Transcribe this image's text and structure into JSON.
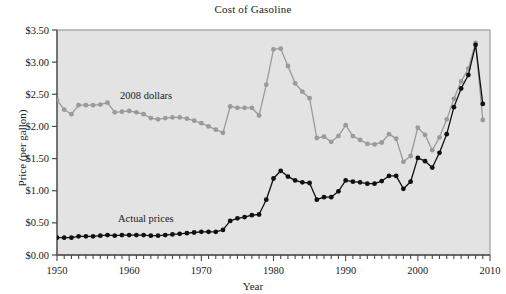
{
  "chart_data": {
    "type": "line",
    "title": "Cost of Gasoline",
    "xlabel": "Year",
    "ylabel": "Price (per gallon)",
    "xlim": [
      1950,
      2010
    ],
    "ylim": [
      0.0,
      3.5
    ],
    "grid": false,
    "legend_position": "inline-annotation",
    "x_tick_labels": [
      "1950",
      "1960",
      "1970",
      "1980",
      "1990",
      "2000",
      "2010"
    ],
    "x_tick_values": [
      1950,
      1960,
      1970,
      1980,
      1990,
      2000,
      2010
    ],
    "x_minor_tick_step": 1,
    "y_tick_labels": [
      "$0.00",
      "$0.50",
      "$1.00",
      "$1.50",
      "$2.00",
      "$2.50",
      "$3.00",
      "$3.50"
    ],
    "y_tick_values": [
      0.0,
      0.5,
      1.0,
      1.5,
      2.0,
      2.5,
      3.0,
      3.5
    ],
    "plot_background": "#e3e3e3",
    "x": [
      1950,
      1951,
      1952,
      1953,
      1954,
      1955,
      1956,
      1957,
      1958,
      1959,
      1960,
      1961,
      1962,
      1963,
      1964,
      1965,
      1966,
      1967,
      1968,
      1969,
      1970,
      1971,
      1972,
      1973,
      1974,
      1975,
      1976,
      1977,
      1978,
      1979,
      1980,
      1981,
      1982,
      1983,
      1984,
      1985,
      1986,
      1987,
      1988,
      1989,
      1990,
      1991,
      1992,
      1993,
      1994,
      1995,
      1996,
      1997,
      1998,
      1999,
      2000,
      2001,
      2002,
      2003,
      2004,
      2005,
      2006,
      2007,
      2008,
      2009
    ],
    "series": [
      {
        "name": "2008 dollars",
        "color": "#9a9a9a",
        "marker": "circle",
        "annotation": "2008 dollars",
        "values": [
          2.41,
          2.26,
          2.19,
          2.33,
          2.33,
          2.33,
          2.34,
          2.37,
          2.22,
          2.23,
          2.24,
          2.22,
          2.19,
          2.13,
          2.11,
          2.13,
          2.14,
          2.14,
          2.12,
          2.09,
          2.05,
          2.0,
          1.95,
          1.9,
          2.31,
          2.29,
          2.29,
          2.29,
          2.17,
          2.65,
          3.2,
          3.21,
          2.94,
          2.67,
          2.54,
          2.44,
          1.82,
          1.84,
          1.76,
          1.85,
          2.02,
          1.85,
          1.79,
          1.73,
          1.72,
          1.75,
          1.88,
          1.81,
          1.45,
          1.54,
          1.98,
          1.87,
          1.63,
          1.83,
          2.11,
          2.43,
          2.7,
          2.9,
          3.3,
          2.1
        ]
      },
      {
        "name": "Actual prices",
        "color": "#101010",
        "marker": "circle",
        "annotation": "Actual prices",
        "values": [
          0.27,
          0.27,
          0.27,
          0.29,
          0.29,
          0.29,
          0.3,
          0.31,
          0.3,
          0.31,
          0.31,
          0.31,
          0.31,
          0.3,
          0.3,
          0.31,
          0.32,
          0.33,
          0.34,
          0.35,
          0.36,
          0.36,
          0.36,
          0.39,
          0.53,
          0.57,
          0.59,
          0.62,
          0.63,
          0.86,
          1.19,
          1.31,
          1.22,
          1.16,
          1.13,
          1.12,
          0.86,
          0.9,
          0.9,
          0.99,
          1.16,
          1.14,
          1.13,
          1.11,
          1.11,
          1.15,
          1.23,
          1.23,
          1.03,
          1.14,
          1.51,
          1.46,
          1.36,
          1.59,
          1.88,
          2.3,
          2.59,
          2.8,
          3.27,
          2.35
        ]
      }
    ]
  }
}
